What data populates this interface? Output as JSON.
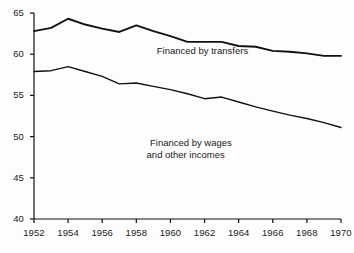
{
  "chart_data": {
    "type": "line",
    "title": "",
    "subtitle": "",
    "xlabel": "",
    "ylabel": "",
    "xlim": [
      1952,
      1970
    ],
    "ylim": [
      40,
      65
    ],
    "grid": false,
    "legend_position": "inline-annotations",
    "x_tick_labels": [
      "1952",
      "1954",
      "1956",
      "1958",
      "1960",
      "1962",
      "1964",
      "1966",
      "1968",
      "1970"
    ],
    "x_ticks": [
      1952,
      1954,
      1956,
      1958,
      1960,
      1962,
      1964,
      1966,
      1968,
      1970
    ],
    "y_tick_labels": [
      "40",
      "45",
      "50",
      "55",
      "60",
      "65"
    ],
    "y_ticks": [
      40,
      45,
      50,
      55,
      60,
      65
    ],
    "x": [
      1952,
      1953,
      1954,
      1955,
      1956,
      1957,
      1958,
      1959,
      1960,
      1961,
      1962,
      1963,
      1964,
      1965,
      1966,
      1967,
      1968,
      1969,
      1970
    ],
    "series": [
      {
        "name": "Financed by transfers",
        "values": [
          62.8,
          63.2,
          64.3,
          63.6,
          63.1,
          62.7,
          63.5,
          62.8,
          62.2,
          61.5,
          61.5,
          61.5,
          61.0,
          60.9,
          60.4,
          60.3,
          60.1,
          59.8,
          59.8
        ]
      },
      {
        "name": "Financed by wages and other incomes",
        "values": [
          57.9,
          58.0,
          58.5,
          57.9,
          57.3,
          56.4,
          56.5,
          56.1,
          55.7,
          55.2,
          54.6,
          54.8,
          54.2,
          53.6,
          53.1,
          52.6,
          52.2,
          51.7,
          51.1
        ]
      }
    ],
    "annotations": [
      {
        "name": "transfers-label",
        "text": "Financed by transfers",
        "x": 1959.2,
        "y": 60.4
      },
      {
        "name": "wages-label-line1",
        "text": "Financed by wages",
        "x": 1958.8,
        "y": 49.2
      },
      {
        "name": "wages-label-line2",
        "text": "and other incomes",
        "x": 1958.6,
        "y": 47.8
      }
    ],
    "colors": {
      "line": "#111111",
      "axis": "#111111",
      "background": "#fdfdfd",
      "text": "#1a1a1a"
    }
  }
}
